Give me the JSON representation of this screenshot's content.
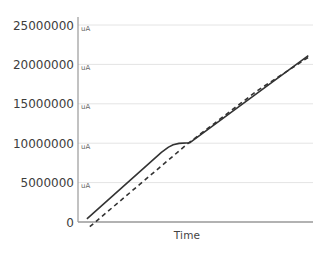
{
  "chart_data": {
    "type": "line",
    "title": "",
    "xlabel": "Time",
    "ylabel": "",
    "unit": "uA",
    "xlim": [
      0,
      1
    ],
    "ylim": [
      0,
      25000000
    ],
    "grid": true,
    "legend": false,
    "y_ticks": [
      {
        "value": 0,
        "label": "0",
        "show_unit": false
      },
      {
        "value": 5000000,
        "label": "5000000",
        "show_unit": true
      },
      {
        "value": 10000000,
        "label": "10000000",
        "show_unit": true
      },
      {
        "value": 15000000,
        "label": "15000000",
        "show_unit": true
      },
      {
        "value": 20000000,
        "label": "20000000",
        "show_unit": true
      },
      {
        "value": 25000000,
        "label": "25000000",
        "show_unit": true
      }
    ],
    "series": [
      {
        "name": "measured-current-solid",
        "style": "solid",
        "color": "#333333",
        "points": [
          [
            0.038,
            400000
          ],
          [
            0.355,
            8850000
          ],
          [
            0.385,
            9500000
          ],
          [
            0.405,
            9800000
          ],
          [
            0.43,
            9980000
          ],
          [
            0.475,
            10050000
          ],
          [
            0.98,
            21100000
          ]
        ]
      },
      {
        "name": "reference-current-dashed",
        "style": "dashed",
        "color": "#333333",
        "points": [
          [
            0.05,
            -600000
          ],
          [
            0.465,
            9900000
          ],
          [
            0.76,
            16600000
          ],
          [
            0.98,
            20900000
          ]
        ]
      }
    ],
    "colors": {
      "axis": "#999999",
      "grid": "#e4e4e4",
      "tick_label": "#3d3d3d",
      "unit_label": "#666666"
    }
  }
}
